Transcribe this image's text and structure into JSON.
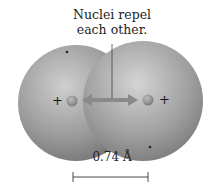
{
  "figure": {
    "annotation_line1": "Nuclei repel",
    "annotation_line2": "each other.",
    "scale_label": "0.74 Å",
    "left_charge": "+",
    "right_charge": "+",
    "colors": {
      "sphere": "#8c8c8c",
      "sphere_highlight": "#c4c4c4",
      "arrow": "#7d7d7d",
      "text": "#222222"
    }
  }
}
